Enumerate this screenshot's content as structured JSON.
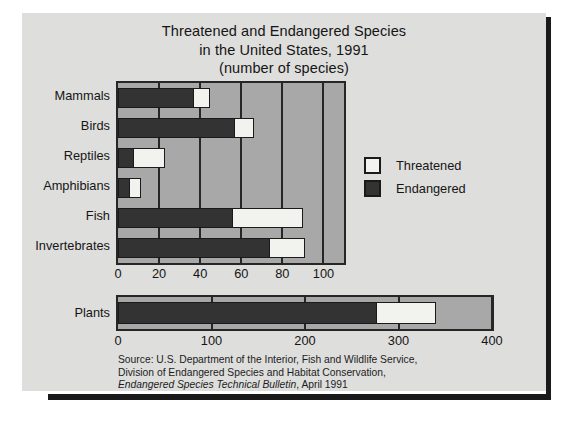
{
  "figure": {
    "title_lines": [
      "Threatened and Endangered Species",
      "in the United States, 1991",
      "(number of species)"
    ],
    "background_color": "#dededc",
    "plot_background_color": "#a8a8a8",
    "frame_color": "#262626"
  },
  "legend": {
    "position": "right-middle",
    "entries": [
      {
        "label": "Threatened",
        "color": "#f2f2ee",
        "swatch_name": "threatened-swatch"
      },
      {
        "label": "Endangered",
        "color": "#333333",
        "swatch_name": "endangered-swatch"
      }
    ]
  },
  "source": {
    "line1": "Source: U.S. Department of the Interior, Fish and Wildlife Service,",
    "line2": "Division of Endangered Species and Habitat Conservation,",
    "line3_italic": "Endangered Species Technical Bulletin",
    "line3_rest": ", April 1991"
  },
  "chart_data": {
    "type": "bar",
    "orientation": "horizontal",
    "stacked": true,
    "title": "Threatened and Endangered Species in the United States, 1991 (number of species)",
    "xlabel": "",
    "ylabel": "",
    "grid": true,
    "legend_position": "right",
    "panels": [
      {
        "name": "animals",
        "categories": [
          "Mammals",
          "Birds",
          "Reptiles",
          "Amphibians",
          "Fish",
          "Invertebrates"
        ],
        "xlim": [
          0,
          110
        ],
        "xticks": [
          0,
          20,
          40,
          60,
          80,
          100
        ],
        "series": [
          {
            "name": "Endangered",
            "color": "#333333",
            "values": [
              37,
              57,
              8,
              6,
              56,
              74
            ]
          },
          {
            "name": "Threatened",
            "color": "#f2f2ee",
            "values": [
              8,
              9,
              15,
              5,
              34,
              17
            ]
          }
        ],
        "totals": [
          45,
          66,
          23,
          11,
          90,
          91
        ]
      },
      {
        "name": "plants",
        "categories": [
          "Plants"
        ],
        "xlim": [
          0,
          400
        ],
        "xticks": [
          0,
          100,
          200,
          300,
          400
        ],
        "series": [
          {
            "name": "Endangered",
            "color": "#333333",
            "values": [
              278
            ]
          },
          {
            "name": "Threatened",
            "color": "#f2f2ee",
            "values": [
              62
            ]
          }
        ],
        "totals": [
          340
        ]
      }
    ]
  }
}
